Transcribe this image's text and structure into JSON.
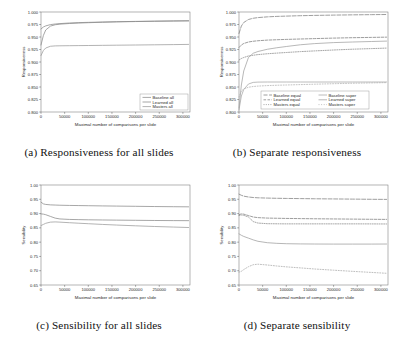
{
  "figure": {
    "background": "#ffffff",
    "panel_count": 4
  },
  "panels": [
    {
      "key": "a",
      "caption": "(a) Responsiveness for all slides"
    },
    {
      "key": "b",
      "caption": "(b) Separate responsiveness"
    },
    {
      "key": "c",
      "caption": "(c) Sensibility for all slides"
    },
    {
      "key": "d",
      "caption": "(d) Separate sensibility"
    }
  ],
  "chart_data": [
    {
      "id": "a",
      "type": "line",
      "title": "(a) Responsiveness for all slides",
      "xlabel": "Maximal number of comparisons per slide",
      "ylabel": "Responsiveness",
      "xlim": [
        0,
        315000
      ],
      "ylim": [
        0.8,
        1.0
      ],
      "xticks": [
        0,
        50000,
        100000,
        150000,
        200000,
        250000,
        300000
      ],
      "xticklabels": [
        "0",
        "50000",
        "100000",
        "150000",
        "200000",
        "250000",
        "300000"
      ],
      "yticks": [
        0.8,
        0.825,
        0.85,
        0.875,
        0.9,
        0.925,
        0.95,
        0.975,
        1.0
      ],
      "yticklabels": [
        "0.800",
        "0.825",
        "0.850",
        "0.875",
        "0.900",
        "0.925",
        "0.950",
        "0.975",
        "1.000"
      ],
      "grid": false,
      "legend_position": "lower right",
      "x": [
        0,
        5000,
        10000,
        20000,
        30000,
        40000,
        60000,
        80000,
        100000,
        130000,
        160000,
        200000,
        240000,
        280000,
        312000
      ],
      "series": [
        {
          "name": "Baseline all",
          "color": "#8a8a8a",
          "dash": "none",
          "values": [
            0.966,
            0.97,
            0.9722,
            0.9748,
            0.976,
            0.9768,
            0.978,
            0.9788,
            0.9793,
            0.98,
            0.9806,
            0.9812,
            0.9817,
            0.9821,
            0.9824
          ]
        },
        {
          "name": "Learned all",
          "color": "#8a8a8a",
          "dash": "none",
          "values": [
            0.934,
            0.953,
            0.964,
            0.9718,
            0.9745,
            0.9757,
            0.977,
            0.9779,
            0.9786,
            0.9795,
            0.9802,
            0.9809,
            0.9815,
            0.982,
            0.9823
          ]
        },
        {
          "name": "Masters all",
          "color": "#9a9a9a",
          "dash": "none",
          "values": [
            0.913,
            0.923,
            0.928,
            0.9315,
            0.9322,
            0.9324,
            0.9326,
            0.9328,
            0.933,
            0.9333,
            0.9336,
            0.934,
            0.9344,
            0.9348,
            0.9352
          ]
        }
      ]
    },
    {
      "id": "b",
      "type": "line",
      "title": "(b) Separate responsiveness",
      "xlabel": "Maximal number of comparisons per slide",
      "ylabel": "Responsiveness",
      "xlim": [
        0,
        315000
      ],
      "ylim": [
        0.8,
        1.0
      ],
      "xticks": [
        0,
        50000,
        100000,
        150000,
        200000,
        250000,
        300000
      ],
      "xticklabels": [
        "0",
        "50000",
        "100000",
        "150000",
        "200000",
        "250000",
        "300000"
      ],
      "yticks": [
        0.8,
        0.825,
        0.85,
        0.875,
        0.9,
        0.925,
        0.95,
        0.975,
        1.0
      ],
      "yticklabels": [
        "0.800",
        "0.825",
        "0.850",
        "0.875",
        "0.900",
        "0.925",
        "0.950",
        "0.975",
        "1.000"
      ],
      "grid": false,
      "legend_position": "lower center",
      "legend_columns": 2,
      "x": [
        0,
        5000,
        10000,
        20000,
        30000,
        40000,
        60000,
        80000,
        100000,
        130000,
        160000,
        200000,
        240000,
        280000,
        312000
      ],
      "series": [
        {
          "name": "Baseline equal",
          "color": "#7d7d7d",
          "dash": "4,1.6",
          "values": [
            0.957,
            0.972,
            0.979,
            0.985,
            0.9875,
            0.9888,
            0.9903,
            0.9912,
            0.9918,
            0.9926,
            0.9932,
            0.9938,
            0.9943,
            0.9947,
            0.995
          ]
        },
        {
          "name": "Learned equal",
          "color": "#7d7d7d",
          "dash": "2.6,1.4",
          "values": [
            0.929,
            0.934,
            0.937,
            0.94,
            0.9415,
            0.9425,
            0.9438,
            0.9445,
            0.9452,
            0.946,
            0.9468,
            0.9478,
            0.9486,
            0.9492,
            0.9497
          ]
        },
        {
          "name": "Masters equal",
          "color": "#8a8a8a",
          "dash": "1,1.3",
          "values": [
            0.904,
            0.907,
            0.909,
            0.912,
            0.9135,
            0.9148,
            0.9165,
            0.9178,
            0.919,
            0.9208,
            0.9222,
            0.924,
            0.9256,
            0.9268,
            0.9278
          ]
        },
        {
          "name": "Baseline super",
          "color": "#a5a5a5",
          "dash": "none",
          "values": [
            0.804,
            0.832,
            0.845,
            0.856,
            0.8592,
            0.8598,
            0.86,
            0.86,
            0.86,
            0.86,
            0.86,
            0.86,
            0.86,
            0.86,
            0.86
          ]
        },
        {
          "name": "Learned super",
          "color": "#a0a0a0",
          "dash": "none",
          "values": [
            0.808,
            0.854,
            0.882,
            0.909,
            0.9175,
            0.921,
            0.9255,
            0.9285,
            0.931,
            0.9345,
            0.9368,
            0.9388,
            0.94,
            0.941,
            0.9418
          ]
        },
        {
          "name": "Masters super",
          "color": "#b0b0b0",
          "dash": "1,1.6",
          "values": [
            0.83,
            0.842,
            0.846,
            0.8495,
            0.851,
            0.8518,
            0.8528,
            0.8535,
            0.854,
            0.8548,
            0.8556,
            0.8566,
            0.8575,
            0.8582,
            0.8588
          ]
        }
      ]
    },
    {
      "id": "c",
      "type": "line",
      "title": "(c) Sensibility for all slides",
      "xlabel": "Maximal number of comparisons per slide",
      "ylabel": "Sensibility",
      "xlim": [
        0,
        315000
      ],
      "ylim": [
        0.65,
        1.0
      ],
      "xticks": [
        0,
        50000,
        100000,
        150000,
        200000,
        250000,
        300000
      ],
      "xticklabels": [
        "0",
        "50000",
        "100000",
        "150000",
        "200000",
        "250000",
        "300000"
      ],
      "yticks": [
        0.65,
        0.7,
        0.75,
        0.8,
        0.85,
        0.9,
        0.95,
        1.0
      ],
      "yticklabels": [
        "0.65",
        "0.70",
        "0.75",
        "0.80",
        "0.85",
        "0.90",
        "0.95",
        "1.00"
      ],
      "grid": false,
      "legend_position": "none",
      "x": [
        0,
        5000,
        10000,
        20000,
        30000,
        40000,
        60000,
        80000,
        100000,
        130000,
        160000,
        200000,
        240000,
        280000,
        312000
      ],
      "series": [
        {
          "name": "Baseline all",
          "color": "#8a8a8a",
          "dash": "none",
          "values": [
            0.94,
            0.934,
            0.932,
            0.9305,
            0.9298,
            0.9292,
            0.9285,
            0.928,
            0.9275,
            0.9268,
            0.9262,
            0.9254,
            0.9246,
            0.924,
            0.9236
          ]
        },
        {
          "name": "Learned all",
          "color": "#8a8a8a",
          "dash": "none",
          "values": [
            0.899,
            0.898,
            0.896,
            0.89,
            0.884,
            0.8812,
            0.8795,
            0.8788,
            0.8782,
            0.8776,
            0.877,
            0.8764,
            0.8758,
            0.8754,
            0.8752
          ]
        },
        {
          "name": "Masters all",
          "color": "#9a9a9a",
          "dash": "none",
          "values": [
            0.858,
            0.862,
            0.866,
            0.87,
            0.8708,
            0.87,
            0.868,
            0.8662,
            0.8645,
            0.862,
            0.8598,
            0.8572,
            0.8548,
            0.8528,
            0.8512
          ]
        }
      ]
    },
    {
      "id": "d",
      "type": "line",
      "title": "(d) Separate sensibility",
      "xlabel": "Maximal number of comparisons per slide",
      "ylabel": "Sensibility",
      "xlim": [
        0,
        315000
      ],
      "ylim": [
        0.65,
        1.0
      ],
      "xticks": [
        0,
        50000,
        100000,
        150000,
        200000,
        250000,
        300000
      ],
      "xticklabels": [
        "0",
        "50000",
        "100000",
        "150000",
        "200000",
        "250000",
        "300000"
      ],
      "yticks": [
        0.65,
        0.7,
        0.75,
        0.8,
        0.85,
        0.9,
        0.95,
        1.0
      ],
      "yticklabels": [
        "0.65",
        "0.70",
        "0.75",
        "0.80",
        "0.85",
        "0.90",
        "0.95",
        "1.00"
      ],
      "grid": false,
      "legend_position": "none",
      "x": [
        0,
        5000,
        10000,
        20000,
        30000,
        40000,
        60000,
        80000,
        100000,
        130000,
        160000,
        200000,
        240000,
        280000,
        312000
      ],
      "series": [
        {
          "name": "Baseline equal",
          "color": "#7d7d7d",
          "dash": "4,1.6",
          "values": [
            0.968,
            0.964,
            0.961,
            0.958,
            0.9562,
            0.9552,
            0.9542,
            0.9535,
            0.953,
            0.9524,
            0.9518,
            0.9512,
            0.9506,
            0.95,
            0.9496
          ]
        },
        {
          "name": "Learned equal",
          "color": "#7d7d7d",
          "dash": "2.6,1.4",
          "values": [
            0.896,
            0.899,
            0.898,
            0.893,
            0.888,
            0.8858,
            0.8842,
            0.8836,
            0.883,
            0.8824,
            0.8818,
            0.8812,
            0.8806,
            0.88,
            0.8796
          ]
        },
        {
          "name": "Masters equal",
          "color": "#8a8a8a",
          "dash": "1,1.3",
          "values": [
            0.893,
            0.895,
            0.894,
            0.888,
            0.872,
            0.8668,
            0.8646,
            0.8642,
            0.864,
            0.864,
            0.864,
            0.864,
            0.864,
            0.8638,
            0.8636
          ]
        },
        {
          "name": "Baseline super",
          "color": "#9e9e9e",
          "dash": "none",
          "values": [
            0.829,
            0.824,
            0.82,
            0.814,
            0.808,
            0.803,
            0.798,
            0.7958,
            0.7945,
            0.7938,
            0.7934,
            0.7932,
            0.7932,
            0.7932,
            0.7934
          ]
        },
        {
          "name": "Learned super",
          "color": "#a8a8a8",
          "dash": "1,1.6",
          "values": [
            0.695,
            0.698,
            0.704,
            0.714,
            0.721,
            0.7228,
            0.72,
            0.7165,
            0.7135,
            0.7098,
            0.706,
            0.7018,
            0.6978,
            0.694,
            0.691
          ]
        }
      ]
    }
  ]
}
